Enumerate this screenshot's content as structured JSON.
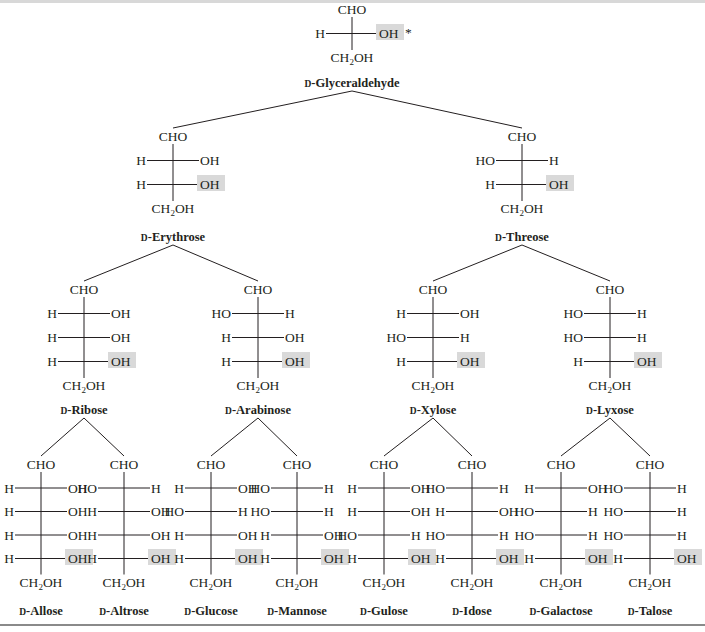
{
  "diagram": {
    "colors": {
      "text": "#231f20",
      "highlight": "#d9d9d9",
      "rule": "#8a8a8a"
    },
    "labels": {
      "top_group": "CHO",
      "bottom_group": "CH2OH",
      "bottom_group_main": "CH",
      "bottom_group_sub": "2",
      "bottom_group_tail": "OH",
      "stereocenter_marker": "*",
      "d_prefix": "D"
    },
    "sugars": [
      {
        "id": "glyceraldehyde",
        "name": "D-Glyceraldehyde",
        "name_rest": "-Glyceraldehyde",
        "x": 352,
        "y_top": 14,
        "spacing": 24,
        "nameY": 87,
        "rows": [
          [
            "H",
            "OH"
          ]
        ],
        "marker_row": 0
      },
      {
        "id": "erythrose",
        "name": "D-Erythrose",
        "name_rest": "-Erythrose",
        "x": 173,
        "y_top": 141,
        "spacing": 24,
        "nameY": 241,
        "rows": [
          [
            "H",
            "OH"
          ],
          [
            "H",
            "OH"
          ]
        ]
      },
      {
        "id": "threose",
        "name": "D-Threose",
        "name_rest": "-Threose",
        "x": 522,
        "y_top": 141,
        "spacing": 24,
        "nameY": 241,
        "rows": [
          [
            "HO",
            "H"
          ],
          [
            "H",
            "OH"
          ]
        ]
      },
      {
        "id": "ribose",
        "name": "D-Ribose",
        "name_rest": "-Ribose",
        "x": 84,
        "y_top": 294,
        "spacing": 24,
        "nameY": 414,
        "rows": [
          [
            "H",
            "OH"
          ],
          [
            "H",
            "OH"
          ],
          [
            "H",
            "OH"
          ]
        ]
      },
      {
        "id": "arabinose",
        "name": "D-Arabinose",
        "name_rest": "-Arabinose",
        "x": 258,
        "y_top": 294,
        "spacing": 24,
        "nameY": 414,
        "rows": [
          [
            "HO",
            "H"
          ],
          [
            "H",
            "OH"
          ],
          [
            "H",
            "OH"
          ]
        ]
      },
      {
        "id": "xylose",
        "name": "D-Xylose",
        "name_rest": "-Xylose",
        "x": 433,
        "y_top": 294,
        "spacing": 24,
        "nameY": 414,
        "rows": [
          [
            "H",
            "OH"
          ],
          [
            "HO",
            "H"
          ],
          [
            "H",
            "OH"
          ]
        ]
      },
      {
        "id": "lyxose",
        "name": "D-Lyxose",
        "name_rest": "-Lyxose",
        "x": 610,
        "y_top": 294,
        "spacing": 24,
        "nameY": 414,
        "rows": [
          [
            "HO",
            "H"
          ],
          [
            "HO",
            "H"
          ],
          [
            "H",
            "OH"
          ]
        ]
      },
      {
        "id": "allose",
        "name": "D-Allose",
        "name_rest": "-Allose",
        "x": 41,
        "y_top": 469,
        "spacing": 23.5,
        "nameY": 615,
        "rows": [
          [
            "H",
            "OH"
          ],
          [
            "H",
            "OH"
          ],
          [
            "H",
            "OH"
          ],
          [
            "H",
            "OH"
          ]
        ]
      },
      {
        "id": "altrose",
        "name": "D-Altrose",
        "name_rest": "-Altrose",
        "x": 124,
        "y_top": 469,
        "spacing": 23.5,
        "nameY": 615,
        "rows": [
          [
            "HO",
            "H"
          ],
          [
            "H",
            "OH"
          ],
          [
            "H",
            "OH"
          ],
          [
            "H",
            "OH"
          ]
        ]
      },
      {
        "id": "glucose",
        "name": "D-Glucose",
        "name_rest": "-Glucose",
        "x": 211,
        "y_top": 469,
        "spacing": 23.5,
        "nameY": 615,
        "rows": [
          [
            "H",
            "OH"
          ],
          [
            "HO",
            "H"
          ],
          [
            "H",
            "OH"
          ],
          [
            "H",
            "OH"
          ]
        ]
      },
      {
        "id": "mannose",
        "name": "D-Mannose",
        "name_rest": "-Mannose",
        "x": 297,
        "y_top": 469,
        "spacing": 23.5,
        "nameY": 615,
        "rows": [
          [
            "HO",
            "H"
          ],
          [
            "HO",
            "H"
          ],
          [
            "H",
            "OH"
          ],
          [
            "H",
            "OH"
          ]
        ]
      },
      {
        "id": "gulose",
        "name": "D-Gulose",
        "name_rest": "-Gulose",
        "x": 384,
        "y_top": 469,
        "spacing": 23.5,
        "nameY": 615,
        "rows": [
          [
            "H",
            "OH"
          ],
          [
            "H",
            "OH"
          ],
          [
            "HO",
            "H"
          ],
          [
            "H",
            "OH"
          ]
        ]
      },
      {
        "id": "idose",
        "name": "D-Idose",
        "name_rest": "-Idose",
        "x": 472,
        "y_top": 469,
        "spacing": 23.5,
        "nameY": 615,
        "rows": [
          [
            "HO",
            "H"
          ],
          [
            "H",
            "OH"
          ],
          [
            "HO",
            "H"
          ],
          [
            "H",
            "OH"
          ]
        ]
      },
      {
        "id": "galactose",
        "name": "D-Galactose",
        "name_rest": "-Galactose",
        "x": 561,
        "y_top": 469,
        "spacing": 23.5,
        "nameY": 615,
        "rows": [
          [
            "H",
            "OH"
          ],
          [
            "HO",
            "H"
          ],
          [
            "HO",
            "H"
          ],
          [
            "H",
            "OH"
          ]
        ]
      },
      {
        "id": "talose",
        "name": "D-Talose",
        "name_rest": "-Talose",
        "x": 650,
        "y_top": 469,
        "spacing": 23.5,
        "nameY": 615,
        "rows": [
          [
            "HO",
            "H"
          ],
          [
            "HO",
            "H"
          ],
          [
            "HO",
            "H"
          ],
          [
            "H",
            "OH"
          ]
        ]
      }
    ],
    "edges": [
      [
        "glyceraldehyde",
        "erythrose"
      ],
      [
        "glyceraldehyde",
        "threose"
      ],
      [
        "erythrose",
        "ribose"
      ],
      [
        "erythrose",
        "arabinose"
      ],
      [
        "threose",
        "xylose"
      ],
      [
        "threose",
        "lyxose"
      ],
      [
        "ribose",
        "allose"
      ],
      [
        "ribose",
        "altrose"
      ],
      [
        "arabinose",
        "glucose"
      ],
      [
        "arabinose",
        "mannose"
      ],
      [
        "xylose",
        "gulose"
      ],
      [
        "xylose",
        "idose"
      ],
      [
        "lyxose",
        "galactose"
      ],
      [
        "lyxose",
        "talose"
      ]
    ]
  }
}
